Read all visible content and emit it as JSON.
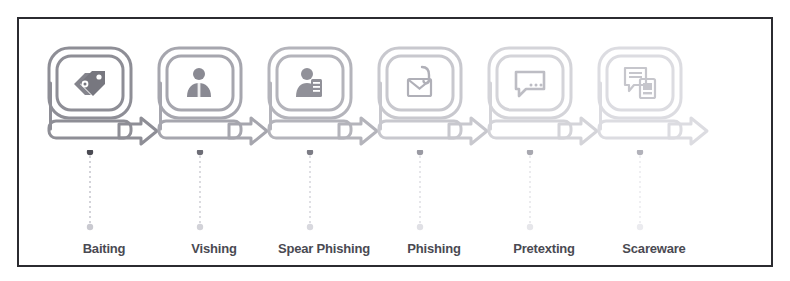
{
  "figure": {
    "kind": "social-engineering-attack-types-flow",
    "clipped_heading_ghost": "",
    "frame_border_color": "#2b2b30",
    "background_color": "#ffffff",
    "label_color": "#4a4a52"
  },
  "stages": [
    {
      "label": "Baiting",
      "icon": "price-tags-icon",
      "tone": "#8e8e96",
      "icon_tone": "#77777f",
      "badge_fill": "#ffffff",
      "body_fill": "#e8e8ec",
      "dot_top": "#4a4a52",
      "dot_bottom": "#c9c9d0"
    },
    {
      "label": "Vishing",
      "icon": "person-with-headset-icon",
      "tone": "#a6a6ae",
      "icon_tone": "#8a8a93",
      "badge_fill": "#ffffff",
      "body_fill": "#ececf0",
      "dot_top": "#6d6d76",
      "dot_bottom": "#d2d2d8"
    },
    {
      "label": "Spear Phishing",
      "icon": "person-with-target-icon",
      "tone": "#b4b4bb",
      "icon_tone": "#919199",
      "badge_fill": "#ffffff",
      "body_fill": "#eeeef2",
      "dot_top": "#7c7c85",
      "dot_bottom": "#d8d8de"
    },
    {
      "label": "Phishing",
      "icon": "envelope-with-hook-icon",
      "tone": "#c8c8ce",
      "icon_tone": "#b0b0b8",
      "badge_fill": "#ffffff",
      "body_fill": "#f3f3f6",
      "dot_top": "#9a9aa3",
      "dot_bottom": "#e0e0e5"
    },
    {
      "label": "Pretexting",
      "icon": "speech-bubble-icon",
      "tone": "#d4d4d9",
      "icon_tone": "#bdbdc4",
      "badge_fill": "#ffffff",
      "body_fill": "#f6f6f8",
      "dot_top": "#a8a8b0",
      "dot_bottom": "#e6e6ea"
    },
    {
      "label": "Scareware",
      "icon": "warning-windows-icon",
      "tone": "#dcdce1",
      "icon_tone": "#c6c6cc",
      "badge_fill": "#ffffff",
      "body_fill": "#f8f8fa",
      "dot_top": "#b2b2ba",
      "dot_bottom": "#ebebef"
    }
  ]
}
